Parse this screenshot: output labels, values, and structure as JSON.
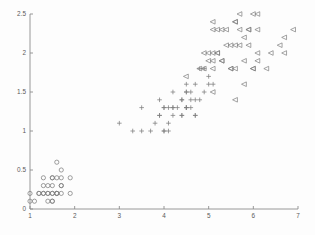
{
  "chart_data": {
    "type": "scatter",
    "title": "",
    "subtitle": "",
    "xlabel": "",
    "ylabel": "",
    "xlim": [
      1,
      7
    ],
    "ylim": [
      0,
      2.5
    ],
    "xticks": [
      1,
      2,
      3,
      4,
      5,
      6,
      7
    ],
    "xticklabels": [
      "1",
      "2",
      "3",
      "4",
      "5",
      "6",
      "7"
    ],
    "yticks": [
      0,
      0.5,
      1,
      1.5,
      2,
      2.5
    ],
    "yticklabels": [
      "0",
      "0.5",
      "1",
      "1.5",
      "2",
      "2.5"
    ],
    "grid": false,
    "legend": "none",
    "spines": [
      "left",
      "bottom"
    ],
    "marker_color": "#7d7d7d",
    "background_color": "#fdfdfd",
    "series": [
      {
        "name": "group-circle",
        "marker": "o",
        "points": [
          [
            1.0,
            0.2
          ],
          [
            1.0,
            0.1
          ],
          [
            1.1,
            0.1
          ],
          [
            1.2,
            0.2
          ],
          [
            1.2,
            0.2
          ],
          [
            1.3,
            0.4
          ],
          [
            1.3,
            0.3
          ],
          [
            1.3,
            0.2
          ],
          [
            1.3,
            0.2
          ],
          [
            1.4,
            0.2
          ],
          [
            1.4,
            0.3
          ],
          [
            1.4,
            0.2
          ],
          [
            1.4,
            0.1
          ],
          [
            1.5,
            0.2
          ],
          [
            1.5,
            0.4
          ],
          [
            1.5,
            0.4
          ],
          [
            1.5,
            0.3
          ],
          [
            1.5,
            0.2
          ],
          [
            1.5,
            0.1
          ],
          [
            1.5,
            0.1
          ],
          [
            1.6,
            0.6
          ],
          [
            1.6,
            0.4
          ],
          [
            1.6,
            0.2
          ],
          [
            1.6,
            0.2
          ],
          [
            1.6,
            0.2
          ],
          [
            1.7,
            0.5
          ],
          [
            1.7,
            0.4
          ],
          [
            1.7,
            0.3
          ],
          [
            1.7,
            0.2
          ],
          [
            1.7,
            0.3
          ],
          [
            1.9,
            0.4
          ],
          [
            1.9,
            0.2
          ]
        ]
      },
      {
        "name": "group-plus",
        "marker": "+",
        "points": [
          [
            3.0,
            1.1
          ],
          [
            3.3,
            1.0
          ],
          [
            3.5,
            1.0
          ],
          [
            3.5,
            1.3
          ],
          [
            3.7,
            1.0
          ],
          [
            3.8,
            1.1
          ],
          [
            3.9,
            1.2
          ],
          [
            3.9,
            1.4
          ],
          [
            3.9,
            1.2
          ],
          [
            4.0,
            1.3
          ],
          [
            4.0,
            1.3
          ],
          [
            4.0,
            1.0
          ],
          [
            4.1,
            1.3
          ],
          [
            4.1,
            1.0
          ],
          [
            4.2,
            1.3
          ],
          [
            4.2,
            1.2
          ],
          [
            4.2,
            1.3
          ],
          [
            4.2,
            1.5
          ],
          [
            4.3,
            1.3
          ],
          [
            4.4,
            1.4
          ],
          [
            4.4,
            1.2
          ],
          [
            4.4,
            1.4
          ],
          [
            4.5,
            1.5
          ],
          [
            4.5,
            1.3
          ],
          [
            4.5,
            1.5
          ],
          [
            4.5,
            1.6
          ],
          [
            4.5,
            1.3
          ],
          [
            4.6,
            1.3
          ],
          [
            4.6,
            1.4
          ],
          [
            4.6,
            1.5
          ],
          [
            4.7,
            1.4
          ],
          [
            4.7,
            1.2
          ],
          [
            4.7,
            1.6
          ],
          [
            4.8,
            1.4
          ],
          [
            4.8,
            1.8
          ],
          [
            4.9,
            1.5
          ],
          [
            4.9,
            1.8
          ],
          [
            5.0,
            1.7
          ],
          [
            5.0,
            1.6
          ],
          [
            5.1,
            1.6
          ],
          [
            4.4,
            1.2
          ],
          [
            4.7,
            1.2
          ],
          [
            4.0,
            1.0
          ],
          [
            4.1,
            1.1
          ],
          [
            4.5,
            1.3
          ]
        ]
      },
      {
        "name": "group-triangle-left",
        "marker": "<",
        "points": [
          [
            4.5,
            1.7
          ],
          [
            4.8,
            1.8
          ],
          [
            4.9,
            2.0
          ],
          [
            5.0,
            1.9
          ],
          [
            5.0,
            2.0
          ],
          [
            5.1,
            2.4
          ],
          [
            5.1,
            2.3
          ],
          [
            5.1,
            2.0
          ],
          [
            5.1,
            1.9
          ],
          [
            5.1,
            1.8
          ],
          [
            5.2,
            2.3
          ],
          [
            5.2,
            2.0
          ],
          [
            5.3,
            2.3
          ],
          [
            5.3,
            1.9
          ],
          [
            5.4,
            2.3
          ],
          [
            5.5,
            2.1
          ],
          [
            5.5,
            1.8
          ],
          [
            5.6,
            2.4
          ],
          [
            5.6,
            2.1
          ],
          [
            5.6,
            2.4
          ],
          [
            5.6,
            1.8
          ],
          [
            5.7,
            2.5
          ],
          [
            5.7,
            2.3
          ],
          [
            5.7,
            2.1
          ],
          [
            5.8,
            2.2
          ],
          [
            5.8,
            1.6
          ],
          [
            5.8,
            1.9
          ],
          [
            5.9,
            2.3
          ],
          [
            5.9,
            2.1
          ],
          [
            6.0,
            2.5
          ],
          [
            6.0,
            1.8
          ],
          [
            6.1,
            2.5
          ],
          [
            6.1,
            1.9
          ],
          [
            6.1,
            2.3
          ],
          [
            6.3,
            1.8
          ],
          [
            6.6,
            2.1
          ],
          [
            6.7,
            2.2
          ],
          [
            6.7,
            2.0
          ],
          [
            6.9,
            2.3
          ],
          [
            5.6,
            1.4
          ],
          [
            5.1,
            1.5
          ],
          [
            5.2,
            2.0
          ],
          [
            5.4,
            2.1
          ],
          [
            5.5,
            1.8
          ],
          [
            5.9,
            2.3
          ],
          [
            6.1,
            2.0
          ],
          [
            6.4,
            2.0
          ],
          [
            6.0,
            1.8
          ],
          [
            5.3,
            1.9
          ],
          [
            4.9,
            1.8
          ]
        ]
      }
    ]
  }
}
